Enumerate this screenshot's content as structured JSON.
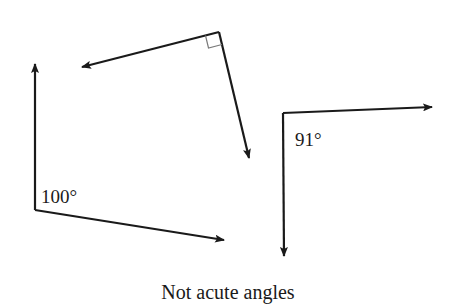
{
  "figure": {
    "caption": "Not acute angles",
    "colors": {
      "line": "#1a1a1a",
      "right_angle_marker": "#7a7a7a",
      "background": "#ffffff"
    },
    "angles": [
      {
        "id": "right-angle",
        "label": "",
        "marker": "right-angle-square",
        "vertex": [
          219,
          32
        ],
        "ray_tips": [
          [
            80,
            67
          ],
          [
            250,
            160
          ]
        ]
      },
      {
        "id": "angle-100",
        "label": "100°",
        "vertex": [
          35,
          210
        ],
        "ray_tips": [
          [
            35,
            62
          ],
          [
            226,
            240
          ]
        ]
      },
      {
        "id": "angle-91",
        "label": "91°",
        "vertex": [
          283,
          113
        ],
        "ray_tips": [
          [
            434,
            107
          ],
          [
            284,
            258
          ]
        ]
      }
    ]
  }
}
